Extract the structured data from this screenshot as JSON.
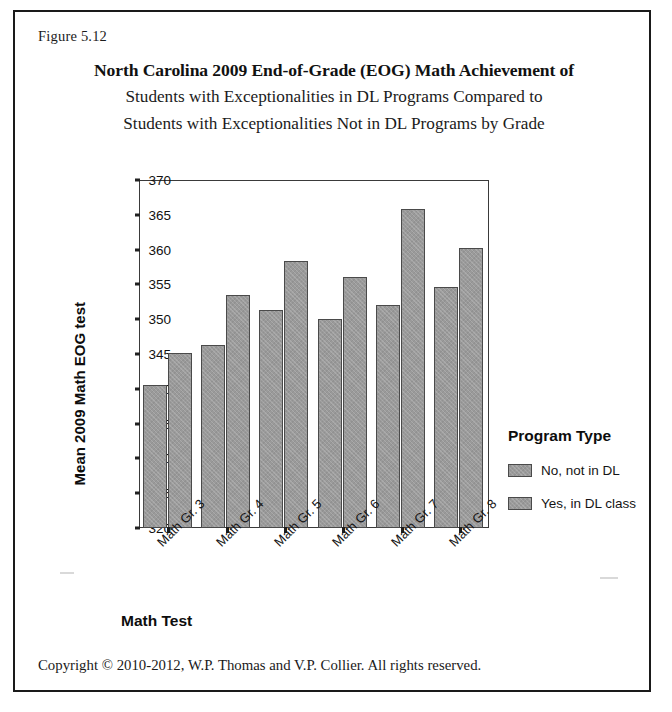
{
  "figure": {
    "number": "Figure 5.12",
    "title_line_1": "North Carolina 2009 End-of-Grade (EOG) Math Achievement of",
    "title_line_2": "Students with Exceptionalities in DL Programs Compared to",
    "title_line_3": "Students with Exceptionalities Not in DL Programs by Grade",
    "copyright": "Copyright © 2010-2012, W.P. Thomas and V.P. Collier.  All rights reserved."
  },
  "legend": {
    "title": "Program Type",
    "entries": [
      {
        "label": "No, not in DL",
        "color": "#9a9a9a"
      },
      {
        "label": "Yes, in DL class",
        "color": "#9a9a9a"
      }
    ]
  },
  "chart_data": {
    "type": "bar",
    "title": "North Carolina 2009 End-of-Grade (EOG) Math Achievement of Students with Exceptionalities in DL Programs Compared to Students with Exceptionalities Not in DL Programs by Grade",
    "xlabel": "Math Test",
    "ylabel": "Mean 2009 Math EOG test",
    "ylim": [
      320,
      370
    ],
    "ytick_step": 5,
    "ytick_labels": [
      "370",
      "365",
      "360",
      "355",
      "350",
      "345",
      "340",
      "335",
      "330",
      "325",
      "320"
    ],
    "grid": false,
    "legend_position": "right",
    "categories": [
      "Math Gr. 3",
      "Math Gr. 4",
      "Math Gr. 5",
      "Math Gr. 6",
      "Math Gr. 7",
      "Math Gr. 8"
    ],
    "series": [
      {
        "name": "No, not in DL",
        "values": [
          340.5,
          346.3,
          351.3,
          350.0,
          352.1,
          354.6
        ]
      },
      {
        "name": "Yes, in DL class",
        "values": [
          345.1,
          353.5,
          358.3,
          356.1,
          365.8,
          360.2
        ]
      }
    ]
  }
}
